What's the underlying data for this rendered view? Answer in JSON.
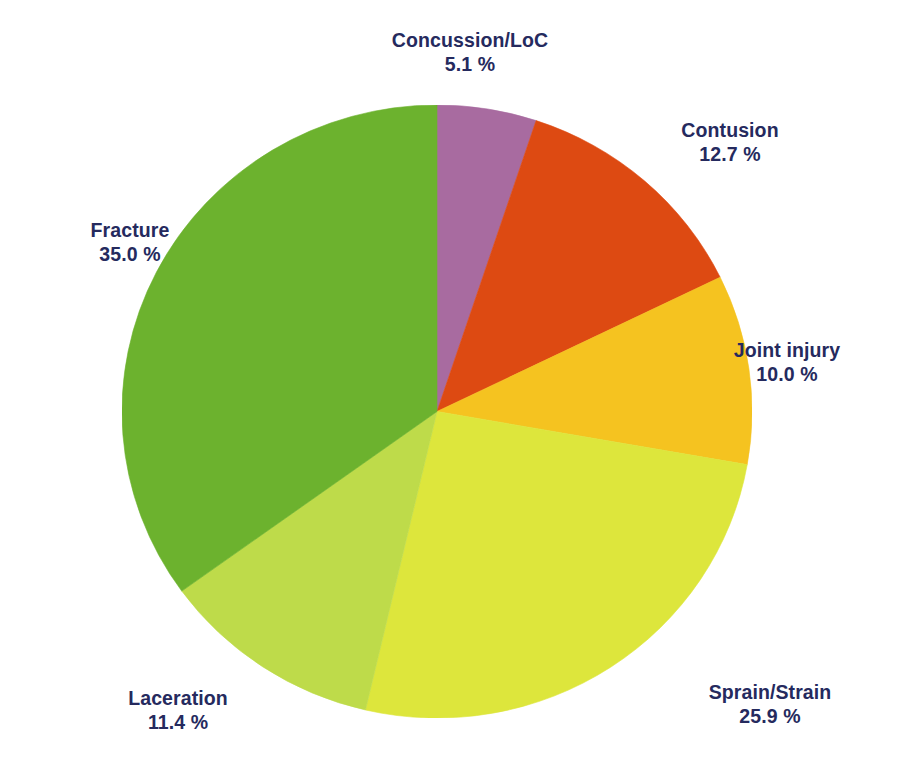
{
  "chart_data": {
    "type": "pie",
    "title": "",
    "subtitle": "",
    "xlabel": "",
    "ylabel": "",
    "unit": "%",
    "legend_position": "none",
    "grid": false,
    "start_angle_deg": 0,
    "direction": "clockwise",
    "categories": [
      "Concussion/LoC",
      "Contusion",
      "Joint injury",
      "Sprain/Strain",
      "Laceration",
      "Fracture"
    ],
    "values": [
      5.1,
      12.7,
      10.0,
      25.9,
      11.4,
      35.0
    ],
    "value_labels": [
      "5.1 %",
      "12.7 %",
      "10.0 %",
      "25.9 %",
      "11.4 %",
      "35.0 %"
    ],
    "colors": [
      "#a86ba0",
      "#dd4a12",
      "#f5c320",
      "#dde63c",
      "#bedb4a",
      "#6cb22e"
    ],
    "slices": [
      {
        "name": "Concussion/LoC",
        "value": 5.1,
        "value_label": "5.1 %",
        "color": "#a86ba0",
        "start_deg": 0.0,
        "end_deg": 18.4
      },
      {
        "name": "Contusion",
        "value": 12.7,
        "value_label": "12.7 %",
        "color": "#dd4a12",
        "start_deg": 18.4,
        "end_deg": 64.1
      },
      {
        "name": "Joint injury",
        "value": 10.0,
        "value_label": "10.0 %",
        "color": "#f5c320",
        "start_deg": 64.1,
        "end_deg": 100.1
      },
      {
        "name": "Sprain/Strain",
        "value": 25.9,
        "value_label": "25.9 %",
        "color": "#dde63c",
        "start_deg": 100.1,
        "end_deg": 193.3
      },
      {
        "name": "Laceration",
        "value": 11.4,
        "value_label": "11.4 %",
        "color": "#bedb4a",
        "start_deg": 193.3,
        "end_deg": 234.3
      },
      {
        "name": "Fracture",
        "value": 35.0,
        "value_label": "35.0 %",
        "color": "#6cb22e",
        "start_deg": 234.3,
        "end_deg": 360.0
      }
    ]
  },
  "labels": {
    "concussion": {
      "name": "Concussion/LoC",
      "value": "5.1 %"
    },
    "contusion": {
      "name": "Contusion",
      "value": "12.7 %"
    },
    "joint": {
      "name": "Joint injury",
      "value": "10.0 %"
    },
    "sprain": {
      "name": "Sprain/Strain",
      "value": "25.9 %"
    },
    "laceration": {
      "name": "Laceration",
      "value": "11.4 %"
    },
    "fracture": {
      "name": "Fracture",
      "value": "35.0 %"
    }
  },
  "theme": {
    "background": "#ffffff",
    "label_color": "#252a5e"
  }
}
